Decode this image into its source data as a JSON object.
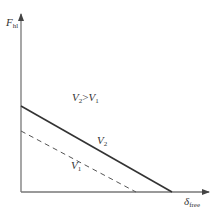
{
  "diagram": {
    "y_axis_label": {
      "main": "F",
      "sub": "hl"
    },
    "x_axis_label": {
      "main": "δ",
      "sub": "free"
    },
    "condition_label": {
      "left_main": "V",
      "left_sub": "2",
      "op": ">",
      "right_main": "V",
      "right_sub": "1"
    },
    "series": [
      {
        "name": "V2",
        "label_main": "V",
        "label_sub": "2",
        "style": "solid",
        "color": "#333333",
        "start": [
          21,
          106
        ],
        "end": [
          172,
          192
        ]
      },
      {
        "name": "V1",
        "label_main": "V",
        "label_sub": "1",
        "style": "dashed",
        "color": "#555555",
        "start": [
          21,
          131
        ],
        "end": [
          136,
          192
        ]
      }
    ],
    "axis_color": "#666666"
  }
}
